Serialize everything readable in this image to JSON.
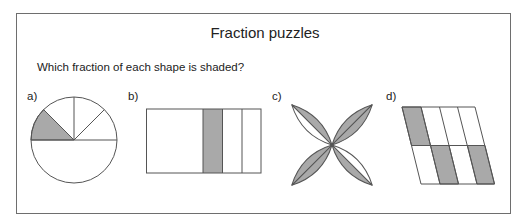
{
  "worksheet": {
    "title": "Fraction puzzles",
    "question": "Which fraction of each shape is shaded?",
    "shade_color": "#a9a9a9",
    "line_color": "#555555",
    "figures": [
      {
        "label": "a)",
        "shape": "circle",
        "parts": "1 of 5 sectors shaded (eighth-sized slice)",
        "shaded_fraction": "1/8"
      },
      {
        "label": "b)",
        "shape": "rectangle",
        "parts": "4 strips, 1 thin strip shaded",
        "shaded_fraction": "1/6"
      },
      {
        "label": "c)",
        "shape": "four-petal flower",
        "parts": "8 half-petals, 6 shaded",
        "shaded_fraction": "3/4"
      },
      {
        "label": "d)",
        "shape": "parallelogram",
        "parts": "8 cells, 3 shaded",
        "shaded_fraction": "3/8"
      }
    ]
  }
}
